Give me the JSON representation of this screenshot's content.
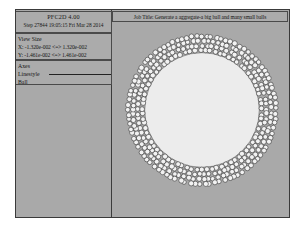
{
  "window": {
    "app_title": "PFC2D 4.00",
    "step_line": "Step 27844 19:05:15 Fri Mar 28 2014"
  },
  "view_size": {
    "heading": "View Size",
    "x_range": "X: -1.320e-002 <=> 1.320e-002",
    "y_range": "Y: -1.461e-002 <=> 1.461e-002"
  },
  "legend": {
    "axes_label": "Axes",
    "linestyle_label": "Linestyle",
    "ball_label": "Ball"
  },
  "plot": {
    "job_title": "Job Title: Generate a aggregate-a big ball and many small balls"
  },
  "colors": {
    "canvas_background": "#a9a9a9",
    "panel_background": "#ababab",
    "border": "#3a3a3a",
    "big_ball_fill": "#ececec",
    "big_ball_stroke": "#777777",
    "small_ball_fill": "#f2f2f2",
    "small_ball_stroke": "#2b2b2b",
    "line_sample": "#222222"
  },
  "chart_data": {
    "type": "scatter",
    "title": "Job Title: Generate a aggregate-a big ball and many small balls",
    "xlabel": "X",
    "ylabel": "Y",
    "xlim": [
      -0.0132,
      0.0132
    ],
    "ylim": [
      -0.01461,
      0.01461
    ],
    "grid": false,
    "legend_position": "left-panel",
    "series": [
      {
        "name": "Big ball",
        "count": 1,
        "center": [
          0.0,
          0.0
        ],
        "radius": 0.0088
      },
      {
        "name": "Small balls",
        "count": 430,
        "arrangement": "annulus",
        "inner_radius": 0.0088,
        "outer_radius": 0.0117,
        "ball_radius": 0.00037,
        "rings": 4
      }
    ]
  }
}
